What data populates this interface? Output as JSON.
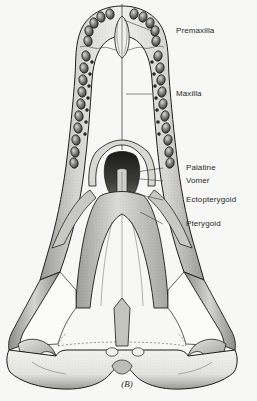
{
  "figure": {
    "caption": "(B)",
    "background_color": "#f7f7f5",
    "ink_color": "#1e1e1e",
    "label_color": "#2a2a2a"
  },
  "labels": [
    {
      "id": "premaxilla",
      "text": "Premaxilla",
      "text_x": 176,
      "text_y": 31,
      "leader_x1": 152,
      "leader_y1": 31,
      "leader_x2": 124,
      "leader_y2": 20
    },
    {
      "id": "maxilla",
      "text": "Maxilla",
      "text_x": 176,
      "text_y": 94,
      "leader_x1": 152,
      "leader_y1": 94,
      "leader_x2": 126,
      "leader_y2": 94
    },
    {
      "id": "palatine",
      "text": "Palatine",
      "text_x": 186,
      "text_y": 168,
      "leader_x1": 163,
      "leader_y1": 168,
      "leader_x2": 136,
      "leader_y2": 172
    },
    {
      "id": "vomer",
      "text": "Vomer",
      "text_x": 186,
      "text_y": 181,
      "leader_x1": 163,
      "leader_y1": 181,
      "leader_x2": 130,
      "leader_y2": 178
    },
    {
      "id": "ectopterygoid",
      "text": "Ectopterygoid",
      "text_x": 186,
      "text_y": 200,
      "leader_x1": 163,
      "leader_y1": 200,
      "leader_x2": 128,
      "leader_y2": 192
    },
    {
      "id": "pterygoid",
      "text": "Pterygoid",
      "text_x": 186,
      "text_y": 224,
      "leader_x1": 163,
      "leader_y1": 224,
      "leader_x2": 140,
      "leader_y2": 212
    }
  ],
  "anatomy": {
    "premaxillary_sockets_left": [
      [
        110,
        14
      ],
      [
        101,
        17
      ],
      [
        94,
        23
      ],
      [
        89,
        31
      ],
      [
        88,
        41
      ]
    ],
    "premaxillary_sockets_right": [
      [
        134,
        14
      ],
      [
        143,
        17
      ],
      [
        150,
        23
      ],
      [
        155,
        31
      ],
      [
        156,
        41
      ]
    ],
    "maxillary_sockets_left": [
      [
        86,
        56
      ],
      [
        84,
        68
      ],
      [
        83,
        80
      ],
      [
        82,
        92
      ],
      [
        81,
        104
      ],
      [
        79,
        116
      ],
      [
        78,
        128
      ],
      [
        76,
        140
      ],
      [
        75,
        152
      ],
      [
        74,
        163
      ]
    ],
    "maxillary_sockets_right": [
      [
        158,
        56
      ],
      [
        160,
        68
      ],
      [
        161,
        80
      ],
      [
        162,
        92
      ],
      [
        163,
        104
      ],
      [
        165,
        116
      ],
      [
        166,
        128
      ],
      [
        168,
        140
      ],
      [
        169,
        152
      ],
      [
        170,
        163
      ]
    ],
    "maxillary_foramina_left": [
      [
        92,
        62
      ],
      [
        90,
        74
      ],
      [
        89,
        86
      ],
      [
        88,
        98
      ],
      [
        87,
        110
      ],
      [
        86,
        122
      ],
      [
        85,
        134
      ]
    ],
    "maxillary_foramina_right": [
      [
        152,
        62
      ],
      [
        154,
        74
      ],
      [
        155,
        86
      ],
      [
        156,
        98
      ],
      [
        157,
        110
      ],
      [
        158,
        122
      ],
      [
        159,
        134
      ]
    ],
    "palatal_foramina": [
      [
        112,
        352
      ],
      [
        138,
        352
      ]
    ],
    "midline_x": 122
  }
}
